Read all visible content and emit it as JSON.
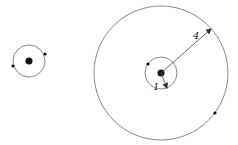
{
  "diagram": {
    "colors": {
      "stroke": "#888888",
      "dot": "#111111",
      "arrow": "#555555",
      "label": "#222222"
    },
    "left_system": {
      "center": [
        29,
        61
      ],
      "orbit_radius": 16,
      "central_body_radius": 3.5,
      "satellites": [
        [
          45,
          54
        ],
        [
          13,
          66
        ]
      ]
    },
    "right_system": {
      "center": [
        161,
        73
      ],
      "inner_orbit_radius": 16,
      "outer_orbit_radius": 67,
      "central_body_radius": 3.5,
      "inner_satellite": [
        148,
        64
      ],
      "outer_satellite": [
        215,
        113
      ],
      "labels": {
        "inner_radius": "1",
        "outer_radius": "4"
      }
    }
  }
}
